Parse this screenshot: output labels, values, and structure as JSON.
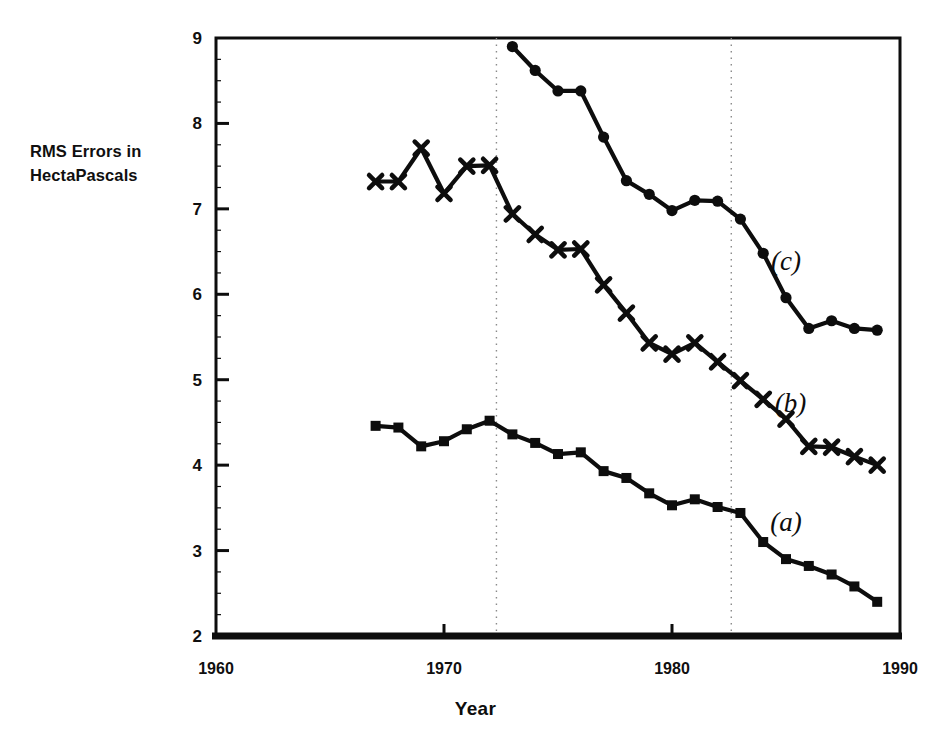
{
  "chart_data": {
    "type": "line",
    "title": "",
    "xlabel": "Year",
    "ylabel": "RMS Errors in HectaPascals",
    "ylabel_line1": "RMS Errors in",
    "ylabel_line2": "HectaPascals",
    "xlim": [
      1960,
      1990
    ],
    "ylim": [
      2,
      9
    ],
    "xticks": [
      1960,
      1970,
      1980,
      1990
    ],
    "xtick_labels": [
      "1960",
      "1970",
      "1980",
      "1990"
    ],
    "yticks": [
      2,
      3,
      4,
      5,
      6,
      7,
      8,
      9
    ],
    "ytick_labels": [
      "2",
      "3",
      "4",
      "5",
      "6",
      "7",
      "8",
      "9"
    ],
    "grid": false,
    "legend_position": "inline-right",
    "vertical_reference_lines": [
      1972.3,
      1982.6
    ],
    "line_color": "#0d0d0d",
    "series": [
      {
        "name": "(a)",
        "label": "(a)",
        "marker": "square",
        "label_x": 1985.0,
        "label_y": 3.23,
        "x": [
          1967,
          1968,
          1969,
          1970,
          1971,
          1972,
          1973,
          1974,
          1975,
          1976,
          1977,
          1978,
          1979,
          1980,
          1981,
          1982,
          1983,
          1984,
          1985,
          1986,
          1987,
          1988,
          1989
        ],
        "values": [
          4.46,
          4.44,
          4.22,
          4.28,
          4.42,
          4.52,
          4.36,
          4.26,
          4.13,
          4.15,
          3.93,
          3.85,
          3.67,
          3.53,
          3.6,
          3.51,
          3.44,
          3.1,
          2.9,
          2.82,
          2.72,
          2.58,
          2.4
        ]
      },
      {
        "name": "(b)",
        "label": "(b)",
        "marker": "x",
        "label_x": 1985.2,
        "label_y": 4.62,
        "x": [
          1967,
          1968,
          1969,
          1970,
          1971,
          1972,
          1973,
          1974,
          1975,
          1976,
          1977,
          1978,
          1979,
          1980,
          1981,
          1982,
          1983,
          1984,
          1985,
          1986,
          1987,
          1988,
          1989
        ],
        "values": [
          7.32,
          7.32,
          7.71,
          7.18,
          7.5,
          7.51,
          6.94,
          6.7,
          6.52,
          6.53,
          6.11,
          5.78,
          5.43,
          5.3,
          5.43,
          5.21,
          4.99,
          4.77,
          4.54,
          4.22,
          4.21,
          4.1,
          4.0
        ]
      },
      {
        "name": "(c)",
        "label": "(c)",
        "marker": "circle",
        "label_x": 1985.0,
        "label_y": 6.28,
        "x": [
          1973,
          1974,
          1975,
          1976,
          1977,
          1978,
          1979,
          1980,
          1981,
          1982,
          1983,
          1984,
          1985,
          1986,
          1987,
          1988,
          1989
        ],
        "values": [
          8.9,
          8.62,
          8.38,
          8.38,
          7.84,
          7.33,
          7.17,
          6.98,
          7.1,
          7.09,
          6.88,
          6.48,
          5.96,
          5.6,
          5.69,
          5.6,
          5.58
        ]
      }
    ]
  }
}
